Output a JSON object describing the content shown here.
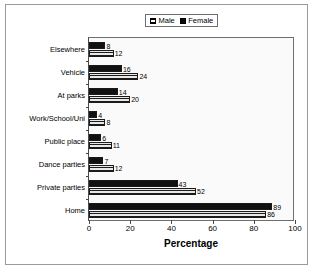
{
  "chart_data": {
    "type": "bar",
    "orientation": "horizontal",
    "title": "",
    "xlabel": "Percentage",
    "ylabel": "",
    "xlim": [
      0,
      100
    ],
    "xticks": [
      0,
      20,
      40,
      60,
      80,
      100
    ],
    "grid": false,
    "legend_position": "top-center",
    "categories": [
      "Elsewhere",
      "Vehicle",
      "At parks",
      "Work/School/Uni",
      "Public place",
      "Dance parties",
      "Private parties",
      "Home"
    ],
    "series": [
      {
        "name": "Female",
        "color": "#111111",
        "pattern": "solid",
        "values": [
          8,
          16,
          14,
          4,
          6,
          7,
          43,
          89
        ]
      },
      {
        "name": "Male",
        "color": "#b5b5b5",
        "pattern": "horizontal-hatch",
        "values": [
          12,
          24,
          20,
          8,
          11,
          12,
          52,
          86
        ]
      }
    ]
  },
  "legend": {
    "items": [
      {
        "label": "Male",
        "swatch": "male"
      },
      {
        "label": "Female",
        "swatch": "female"
      }
    ]
  },
  "axis": {
    "x_title": "Percentage",
    "x_tick_labels": [
      "0",
      "20",
      "40",
      "60",
      "80",
      "100"
    ]
  }
}
